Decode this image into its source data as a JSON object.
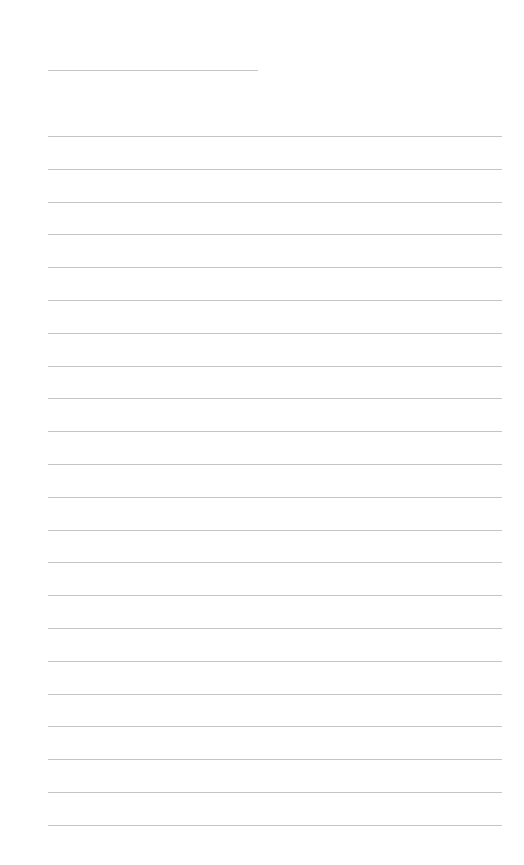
{
  "document": {
    "type": "lined-notepaper",
    "header": {
      "text": ""
    },
    "line_color": "#c4c4c4",
    "background": "#ffffff",
    "lines": [
      {
        "text": ""
      },
      {
        "text": ""
      },
      {
        "text": ""
      },
      {
        "text": ""
      },
      {
        "text": ""
      },
      {
        "text": ""
      },
      {
        "text": ""
      },
      {
        "text": ""
      },
      {
        "text": ""
      },
      {
        "text": ""
      },
      {
        "text": ""
      },
      {
        "text": ""
      },
      {
        "text": ""
      },
      {
        "text": ""
      },
      {
        "text": ""
      },
      {
        "text": ""
      },
      {
        "text": ""
      },
      {
        "text": ""
      },
      {
        "text": ""
      },
      {
        "text": ""
      },
      {
        "text": ""
      },
      {
        "text": ""
      }
    ]
  }
}
